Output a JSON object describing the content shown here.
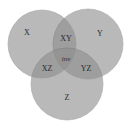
{
  "diagram": {
    "type": "venn-3",
    "colors": {
      "fill": "#8f8f8f",
      "stroke": "#7a7a7a",
      "background": "#ffffff"
    },
    "sets": [
      {
        "id": "X",
        "label": "X"
      },
      {
        "id": "Y",
        "label": "Y"
      },
      {
        "id": "Z",
        "label": "Z"
      }
    ],
    "regions": {
      "xy": "XY",
      "xz": "XZ",
      "yz": "YZ",
      "xyz": "inv"
    }
  }
}
